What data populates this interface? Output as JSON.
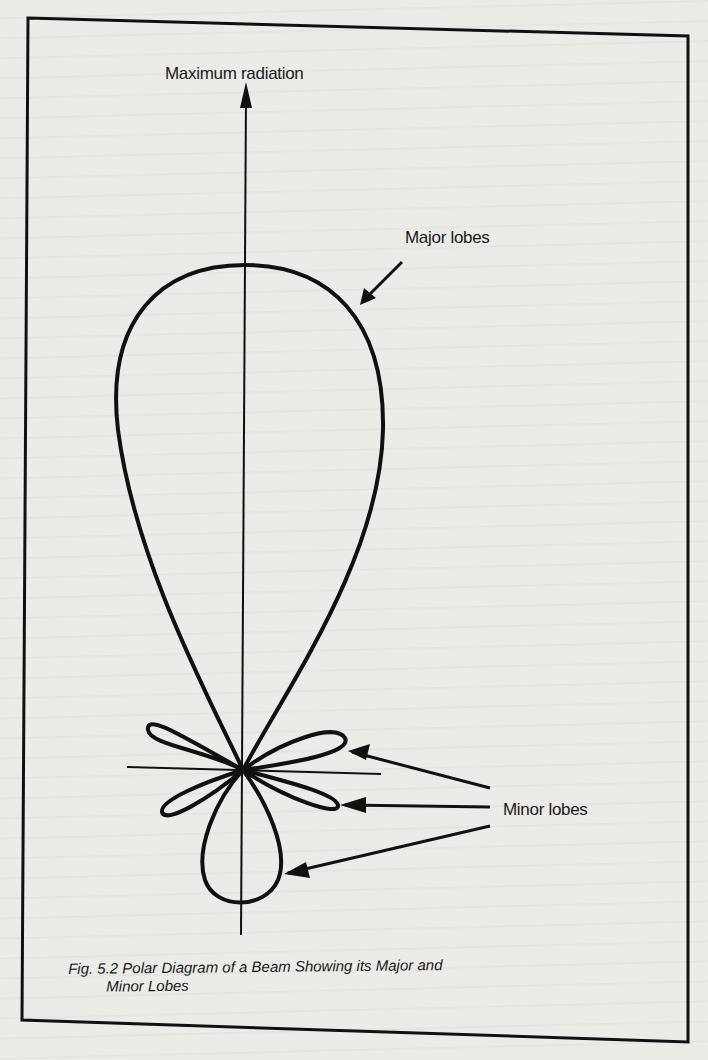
{
  "figure": {
    "caption_line1": "Fig. 5.2 Polar Diagram of a Beam Showing its Major and",
    "caption_line2": "Minor Lobes"
  },
  "labels": {
    "maximum_radiation": "Maximum radiation",
    "major_lobes": "Major lobes",
    "minor_lobes": "Minor lobes"
  },
  "diagram": {
    "type": "polar radiation pattern",
    "major_lobe_count": 1,
    "minor_lobe_count": 5,
    "arrows": [
      {
        "target": "maximum-radiation-direction",
        "label": "Maximum radiation"
      },
      {
        "target": "major-lobe",
        "label": "Major lobes"
      },
      {
        "target": "upper-right-minor-lobe",
        "label": "Minor lobes"
      },
      {
        "target": "lower-right-minor-lobe",
        "label": "Minor lobes"
      },
      {
        "target": "back-lobe",
        "label": "Minor lobes"
      }
    ],
    "colors": {
      "ink": "#111111",
      "paper": "#ebebe8"
    }
  }
}
